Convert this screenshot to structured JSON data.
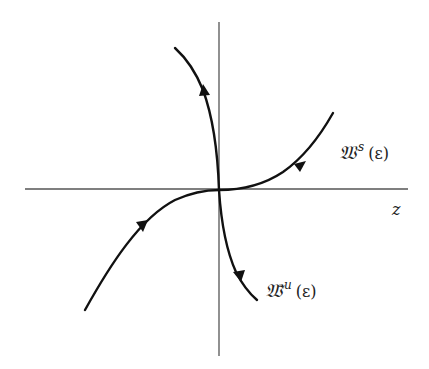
{
  "figure": {
    "axes": {
      "horizontal_label": "z"
    },
    "manifolds": {
      "stable": {
        "symbol": "𝔚",
        "superscript": "s",
        "argument": "(ε)"
      },
      "unstable": {
        "symbol": "𝔚̃",
        "superscript": "u",
        "argument": "(ε)"
      }
    },
    "colors": {
      "curve": "#111111",
      "axis": "#555555",
      "background": "#ffffff"
    }
  }
}
